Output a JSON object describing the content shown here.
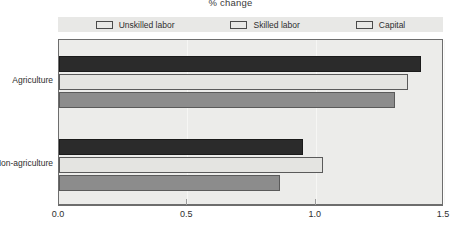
{
  "chart_data": {
    "type": "bar",
    "orientation": "horizontal",
    "title": "% change",
    "xlabel": "",
    "ylabel": "",
    "xlim": [
      0.0,
      1.5
    ],
    "xticks": [
      "0.0",
      "0.5",
      "1.0",
      "1.5"
    ],
    "xtick_values": [
      0.0,
      0.5,
      1.0,
      1.5
    ],
    "grid": true,
    "legend_position": "top",
    "categories": [
      "Agriculture",
      "Non-agriculture"
    ],
    "series": [
      {
        "name": "Unskilled labor",
        "color": "#2b2b2b",
        "values": [
          1.41,
          0.95
        ]
      },
      {
        "name": "Skilled labor",
        "color": "#e4e4e1",
        "values": [
          1.36,
          1.03
        ]
      },
      {
        "name": "Capital",
        "color": "#8c8c8c",
        "values": [
          1.31,
          0.86
        ]
      }
    ]
  }
}
